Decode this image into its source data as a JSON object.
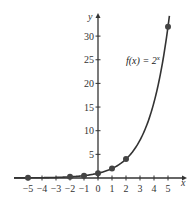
{
  "chart_data": {
    "type": "line",
    "title": "",
    "xlabel": "x",
    "ylabel": "y",
    "xlim": [
      -6,
      6
    ],
    "ylim": [
      0,
      34
    ],
    "grid": false,
    "function_label": "f(x) = 2^x",
    "function_label_parts": {
      "prefix": "f(x) = 2",
      "exponent": "x"
    },
    "x_ticks": [
      -5,
      -4,
      -3,
      -2,
      -1,
      0,
      1,
      2,
      3,
      4,
      5
    ],
    "y_ticks": [
      5,
      10,
      15,
      20,
      25,
      30
    ],
    "points": {
      "x": [
        -5,
        -2,
        -1,
        0,
        1,
        2,
        5
      ],
      "y": [
        0.03125,
        0.25,
        0.5,
        1,
        2,
        4,
        32
      ]
    },
    "series": [
      {
        "name": "f(x) = 2^x",
        "x": [
          -6,
          -5,
          -4,
          -3,
          -2,
          -1,
          0,
          1,
          2,
          3,
          4,
          5,
          5.1
        ],
        "y": [
          0.016,
          0.031,
          0.063,
          0.125,
          0.25,
          0.5,
          1,
          2,
          4,
          8,
          16,
          32,
          34.3
        ]
      }
    ],
    "colors": {
      "curve": "#333333",
      "axis": "#333333",
      "points": "#444444"
    }
  },
  "labels": {
    "x_axis": "x",
    "y_axis": "y",
    "x_tick_labels": [
      "−5",
      "−4",
      "−3",
      "−2",
      "−1",
      "0",
      "1",
      "2",
      "3",
      "4",
      "5"
    ],
    "y_tick_labels": [
      "5",
      "10",
      "15",
      "20",
      "25",
      "30"
    ]
  }
}
